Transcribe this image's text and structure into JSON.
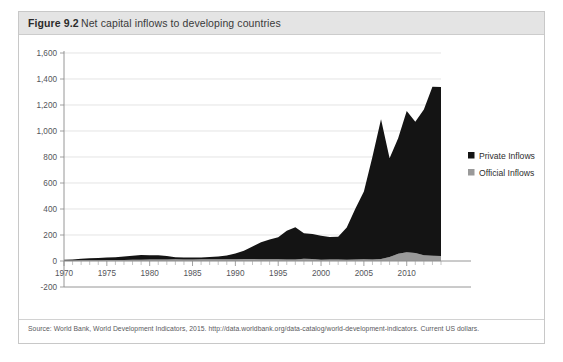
{
  "figure": {
    "label": "Figure 9.2",
    "title": "Net capital inflows to developing countries",
    "source": "Source: World Bank, World Development Indicators, 2015. http://data.worldbank.org/data-catalog/world-development-indicators. Current US dollars."
  },
  "colors": {
    "private": "#141414",
    "official": "#9a9a9a",
    "grid": "#d9d9d9",
    "axis": "#8a8a8a",
    "header_band": "#e4e4e4",
    "frame": "#c8c8c8",
    "text": "#55555a"
  },
  "legend": {
    "position": "right",
    "items": [
      {
        "label": "Private Inflows",
        "color": "#141414",
        "key": "private"
      },
      {
        "label": "Official Inflows",
        "color": "#9a9a9a",
        "key": "official"
      }
    ]
  },
  "chart_data": {
    "type": "area",
    "stacked": true,
    "title": "Net capital inflows to developing countries",
    "xlabel": "",
    "ylabel": "",
    "ylim": [
      -200,
      1600
    ],
    "ytick_step": 200,
    "ytick_labels": [
      "-200",
      "0",
      "200",
      "400",
      "600",
      "800",
      "1,000",
      "1,200",
      "1,400",
      "1,600"
    ],
    "ytick_values": [
      -200,
      0,
      200,
      400,
      600,
      800,
      1000,
      1200,
      1400,
      1600
    ],
    "xlim": [
      1970,
      2014
    ],
    "xtick_labels": [
      "1970",
      "1975",
      "1980",
      "1985",
      "1990",
      "1995",
      "2000",
      "2005",
      "2010"
    ],
    "xtick_values": [
      1970,
      1975,
      1980,
      1985,
      1990,
      1995,
      2000,
      2005,
      2010
    ],
    "xtick_minor_step": 1,
    "grid": true,
    "units": "Current US dollars (billions)",
    "x": [
      1970,
      1971,
      1972,
      1973,
      1974,
      1975,
      1976,
      1977,
      1978,
      1979,
      1980,
      1981,
      1982,
      1983,
      1984,
      1985,
      1986,
      1987,
      1988,
      1989,
      1990,
      1991,
      1992,
      1993,
      1994,
      1995,
      1996,
      1997,
      1998,
      1999,
      2000,
      2001,
      2002,
      2003,
      2004,
      2005,
      2006,
      2007,
      2008,
      2009,
      2010,
      2011,
      2012,
      2013,
      2014
    ],
    "series": [
      {
        "name": "Official Inflows",
        "color": "#9a9a9a",
        "values": [
          4,
          4,
          5,
          5,
          6,
          7,
          7,
          8,
          9,
          10,
          11,
          12,
          12,
          13,
          12,
          12,
          13,
          14,
          13,
          13,
          14,
          16,
          15,
          14,
          13,
          14,
          12,
          11,
          18,
          16,
          10,
          12,
          11,
          10,
          12,
          14,
          12,
          15,
          30,
          55,
          68,
          62,
          45,
          40,
          38
        ]
      },
      {
        "name": "Private Inflows",
        "color": "#141414",
        "values": [
          6,
          8,
          12,
          16,
          18,
          20,
          22,
          26,
          32,
          36,
          34,
          33,
          26,
          16,
          14,
          14,
          14,
          16,
          22,
          30,
          44,
          62,
          96,
          130,
          152,
          168,
          220,
          248,
          196,
          192,
          184,
          172,
          176,
          248,
          390,
          520,
          790,
          1075,
          760,
          890,
          1085,
          1010,
          1120,
          1300,
          1300
        ]
      }
    ],
    "annotations": [
      {
        "text": "Peak before Asian financial crisis",
        "year": 1997,
        "value": 259
      },
      {
        "text": "Pre-global-financial-crisis peak",
        "year": 2007,
        "value": 1090
      },
      {
        "text": "Global financial crisis trough",
        "year": 2008,
        "value": 790
      }
    ]
  }
}
